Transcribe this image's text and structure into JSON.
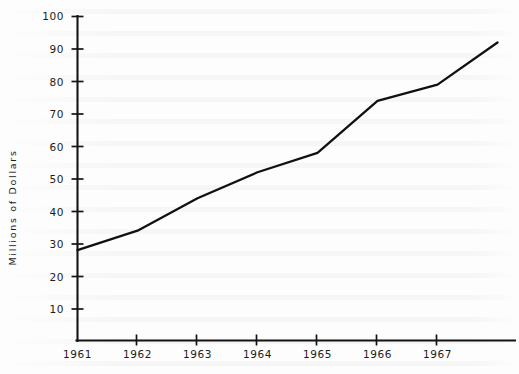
{
  "chart_data": {
    "type": "line",
    "title": "",
    "subtitle": "",
    "xlabel": "",
    "ylabel": "Millions of Dollars",
    "x": [
      1961,
      1962,
      1963,
      1964,
      1965,
      1966,
      1967,
      1968
    ],
    "values": [
      28,
      34,
      44,
      52,
      58,
      74,
      79,
      92
    ],
    "series": [
      {
        "name": "Millions of Dollars",
        "values": [
          28,
          34,
          44,
          52,
          58,
          74,
          79,
          92
        ]
      }
    ],
    "xtick_labels": [
      "1961",
      "1962",
      "1963",
      "1964",
      "1965",
      "1966",
      "1967"
    ],
    "ytick_labels": [
      "100",
      "90",
      "80",
      "70",
      "60",
      "50",
      "40",
      "30",
      "20",
      "10"
    ],
    "ytick_values": [
      100,
      90,
      80,
      70,
      60,
      50,
      40,
      30,
      20,
      10
    ],
    "xlim": [
      1961,
      1968.05
    ],
    "ylim": [
      0,
      100
    ],
    "grid": false,
    "legend": false,
    "legend_position": "none",
    "line_color": "#111111",
    "axis_color": "#141414",
    "background_color": "#fdfdfd",
    "annotations": []
  }
}
